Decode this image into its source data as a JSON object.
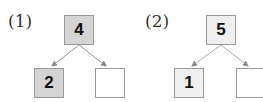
{
  "problems": [
    {
      "label": "(1)",
      "top": "4",
      "left": "2",
      "right": "",
      "shading": "#d4d4d4"
    },
    {
      "label": "(2)",
      "top": "5",
      "left": "1",
      "right": "",
      "shading": "#efefef"
    }
  ]
}
